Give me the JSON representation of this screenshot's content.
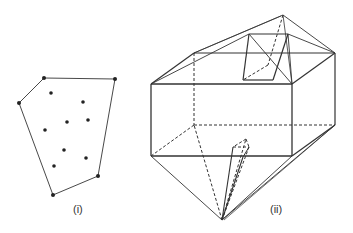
{
  "figure_i": {
    "label": "(i)",
    "label_pos": [
      73,
      203
    ],
    "hull": [
      [
        44,
        78
      ],
      [
        115,
        79
      ],
      [
        98,
        176
      ],
      [
        53,
        195
      ],
      [
        19,
        103
      ]
    ],
    "interior_points": [
      [
        51,
        93
      ],
      [
        83,
        102
      ],
      [
        67,
        122
      ],
      [
        88,
        120
      ],
      [
        45,
        130
      ],
      [
        64,
        150
      ],
      [
        86,
        158
      ],
      [
        54,
        166
      ]
    ]
  },
  "figure_ii": {
    "label": "(ii)",
    "label_pos": [
      270,
      203
    ],
    "box": {
      "top_front_left": [
        151,
        84
      ],
      "top_front_right": [
        292,
        84
      ],
      "top_back_left": [
        194,
        53
      ],
      "top_back_right": [
        335,
        53
      ],
      "bot_front_left": [
        151,
        156
      ],
      "bot_front_right": [
        292,
        156
      ],
      "bot_back_left": [
        194,
        125
      ],
      "bot_back_right": [
        335,
        125
      ]
    },
    "top_apex": [
      283,
      15
    ],
    "bottom_apex": [
      222,
      220
    ],
    "inner_quad": [
      [
        249,
        34
      ],
      [
        288,
        34
      ],
      [
        273,
        80
      ],
      [
        243,
        80
      ]
    ],
    "inner_dashed_point": [
      268,
      65
    ],
    "small_triangle": [
      [
        246,
        139
      ],
      [
        233,
        147
      ],
      [
        249,
        147
      ]
    ],
    "small_triangle_base": [
      243,
      157
    ]
  },
  "colors": {
    "line": "#333333",
    "point": "#222222"
  }
}
